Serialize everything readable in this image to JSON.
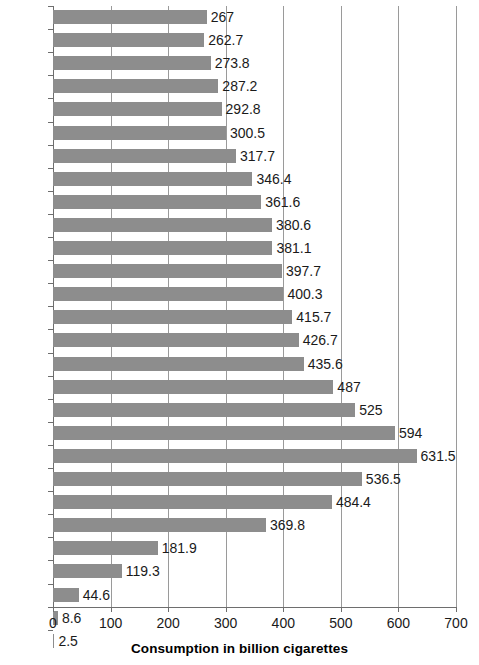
{
  "chart_data": {
    "type": "bar",
    "orientation": "horizontal",
    "title": "",
    "subtitle": "",
    "xlabel": "Consumption in billion cigarettes",
    "ylabel": "",
    "xlim": [
      0,
      700
    ],
    "xticks": [
      0,
      100,
      200,
      300,
      400,
      500,
      600,
      700
    ],
    "grid": "vertical",
    "legend": "none",
    "bar_color": "#8d8d8d",
    "categories": [
      "2015",
      "2014",
      "2013",
      "2012",
      "2011",
      "2010",
      "2009",
      "2008",
      "2007",
      "2006",
      "2005",
      "2004",
      "2003",
      "2002",
      "2001",
      "2000",
      "1995",
      "1990",
      "1985",
      "1980",
      "1970",
      "1960",
      "1950",
      "1940",
      "1930",
      "1920",
      "1910",
      "1900"
    ],
    "values": [
      267,
      262.7,
      273.8,
      287.2,
      292.8,
      300.5,
      317.7,
      346.4,
      361.6,
      380.6,
      381.1,
      397.7,
      400.3,
      415.7,
      426.7,
      435.6,
      487,
      525,
      594,
      631.5,
      536.5,
      484.4,
      369.8,
      181.9,
      119.3,
      44.6,
      8.6,
      2.5
    ],
    "value_labels": [
      "267",
      "262.7",
      "273.8",
      "287.2",
      "292.8",
      "300.5",
      "317.7",
      "346.4",
      "361.6",
      "380.6",
      "381.1",
      "397.7",
      "400.3",
      "415.7",
      "426.7",
      "435.6",
      "487",
      "525",
      "594",
      "631.5",
      "536.5",
      "484.4",
      "369.8",
      "181.9",
      "119.3",
      "44.6",
      "8.6",
      "2.5"
    ]
  }
}
